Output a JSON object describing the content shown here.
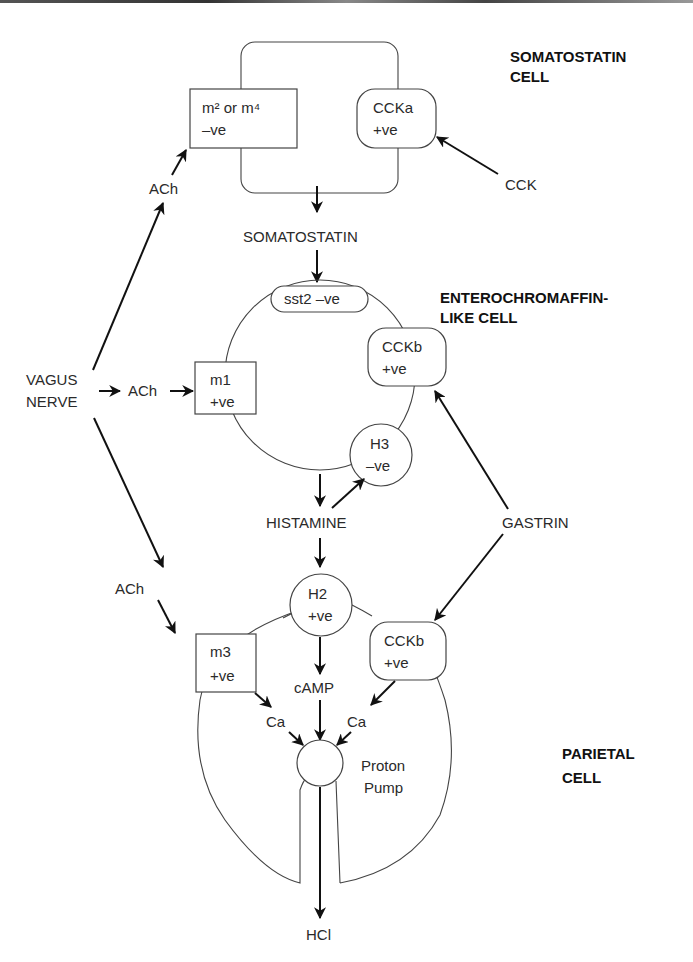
{
  "titles": {
    "somatostatin_cell": [
      "SOMATOSTATIN",
      "CELL"
    ],
    "ecl_cell": [
      "ENTEROCHROMAFFIN-",
      "LIKE CELL"
    ],
    "parietal_cell": [
      "PARIETAL",
      "CELL"
    ]
  },
  "receptors": {
    "m2m4": {
      "line1": "m² or m⁴",
      "line2": "–ve"
    },
    "ccka": {
      "line1": "CCKa",
      "line2": "+ve"
    },
    "sst2": {
      "line1": "sst2 –ve"
    },
    "ccb_ecl": {
      "line1": "CCKb",
      "line2": "+ve"
    },
    "m1": {
      "line1": "m1",
      "line2": "+ve"
    },
    "h3": {
      "line1": "H3",
      "line2": "–ve"
    },
    "h2": {
      "line1": "H2",
      "line2": "+ve"
    },
    "m3": {
      "line1": "m3",
      "line2": "+ve"
    },
    "ccb_parietal": {
      "line1": "CCKb",
      "line2": "+ve"
    }
  },
  "labels": {
    "vagus": [
      "VAGUS",
      "NERVE"
    ],
    "ach_top": "ACh",
    "ach_mid": "ACh",
    "ach_low": "ACh",
    "cck": "CCK",
    "somatostatin": "SOMATOSTATIN",
    "histamine": "HISTAMINE",
    "gastrin": "GASTRIN",
    "camp": "cAMP",
    "ca_left": "Ca",
    "ca_right": "Ca",
    "proton_pump": [
      "Proton",
      "Pump"
    ],
    "hcl": "HCl"
  }
}
